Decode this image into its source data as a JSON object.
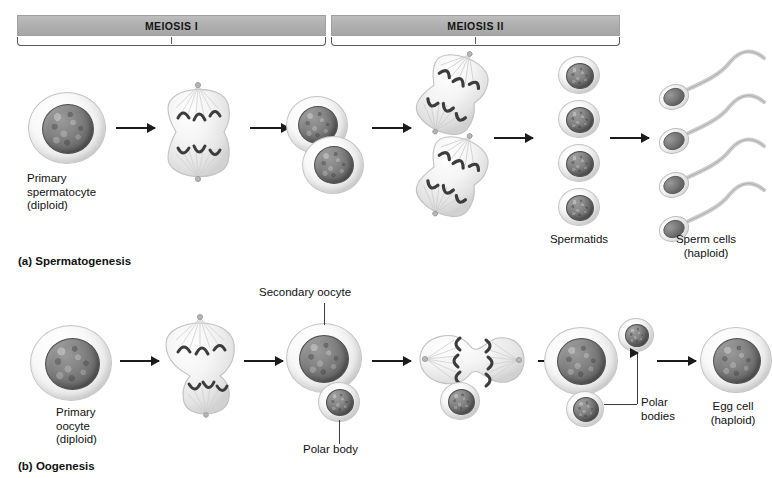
{
  "figure": {
    "background_color": "#ffffff",
    "bar_color": "#b0b0b0",
    "cell_fill_color": "#eeeeee",
    "nucleus_color": "#6f6f6f",
    "arrow_color": "#1b1b1b"
  },
  "phase_bars": [
    {
      "id": "meiosis-1",
      "label": "MEIOSIS I"
    },
    {
      "id": "meiosis-2",
      "label": "MEIOSIS II"
    }
  ],
  "panels": [
    {
      "id": "spermatogenesis",
      "label": "(a) Spermatogenesis"
    },
    {
      "id": "oogenesis",
      "label": "(b) Oogenesis"
    }
  ],
  "spermatogenesis": {
    "stages": [
      {
        "id": "primary-spermatocyte",
        "label": "Primary\nspermatocyte\n(diploid)",
        "cells": 1,
        "ploidy": "diploid"
      },
      {
        "id": "meiosis-1-division",
        "label": "",
        "cells": 1,
        "ploidy": "diploid"
      },
      {
        "id": "secondary-spermatocytes",
        "label": "",
        "cells": 2,
        "ploidy": "haploid"
      },
      {
        "id": "meiosis-2-division",
        "label": "",
        "cells": 2,
        "ploidy": "haploid"
      },
      {
        "id": "spermatids",
        "label": "Spermatids",
        "cells": 4,
        "ploidy": "haploid"
      },
      {
        "id": "sperm-cells",
        "label": "Sperm cells\n(haploid)",
        "cells": 4,
        "ploidy": "haploid"
      }
    ],
    "arrow_count": 5
  },
  "oogenesis": {
    "stages": [
      {
        "id": "primary-oocyte",
        "label": "Primary\noocyte\n(diploid)",
        "cells": 1,
        "ploidy": "diploid"
      },
      {
        "id": "meiosis-1-division",
        "label": "",
        "cells": 1,
        "ploidy": "diploid"
      },
      {
        "id": "secondary-oocyte",
        "label": "Secondary oocyte",
        "second_label": "Polar body",
        "cells": 2,
        "ploidy": "haploid"
      },
      {
        "id": "meiosis-2-division",
        "label": "",
        "cells": 2,
        "ploidy": "haploid"
      },
      {
        "id": "polar-bodies",
        "label": "Polar\nbodies",
        "cells": 3,
        "ploidy": "haploid"
      },
      {
        "id": "egg-cell",
        "label": "Egg cell\n(haploid)",
        "cells": 1,
        "ploidy": "haploid"
      }
    ],
    "arrow_count": 5
  }
}
